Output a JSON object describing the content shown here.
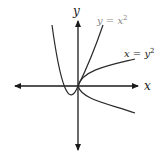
{
  "diagram": {
    "axes": {
      "x_label": "x",
      "y_label": "y"
    },
    "curves": [
      {
        "name": "parabola-y-equals-x-squared",
        "label_base": "y = x",
        "label_sup": "2"
      },
      {
        "name": "parabola-x-equals-y-squared",
        "label_base": "x = y",
        "label_sup": "2"
      }
    ],
    "colors": {
      "axis": "#1a1a1a",
      "curve": "#2a2a2a",
      "label_light": "#888888"
    }
  }
}
